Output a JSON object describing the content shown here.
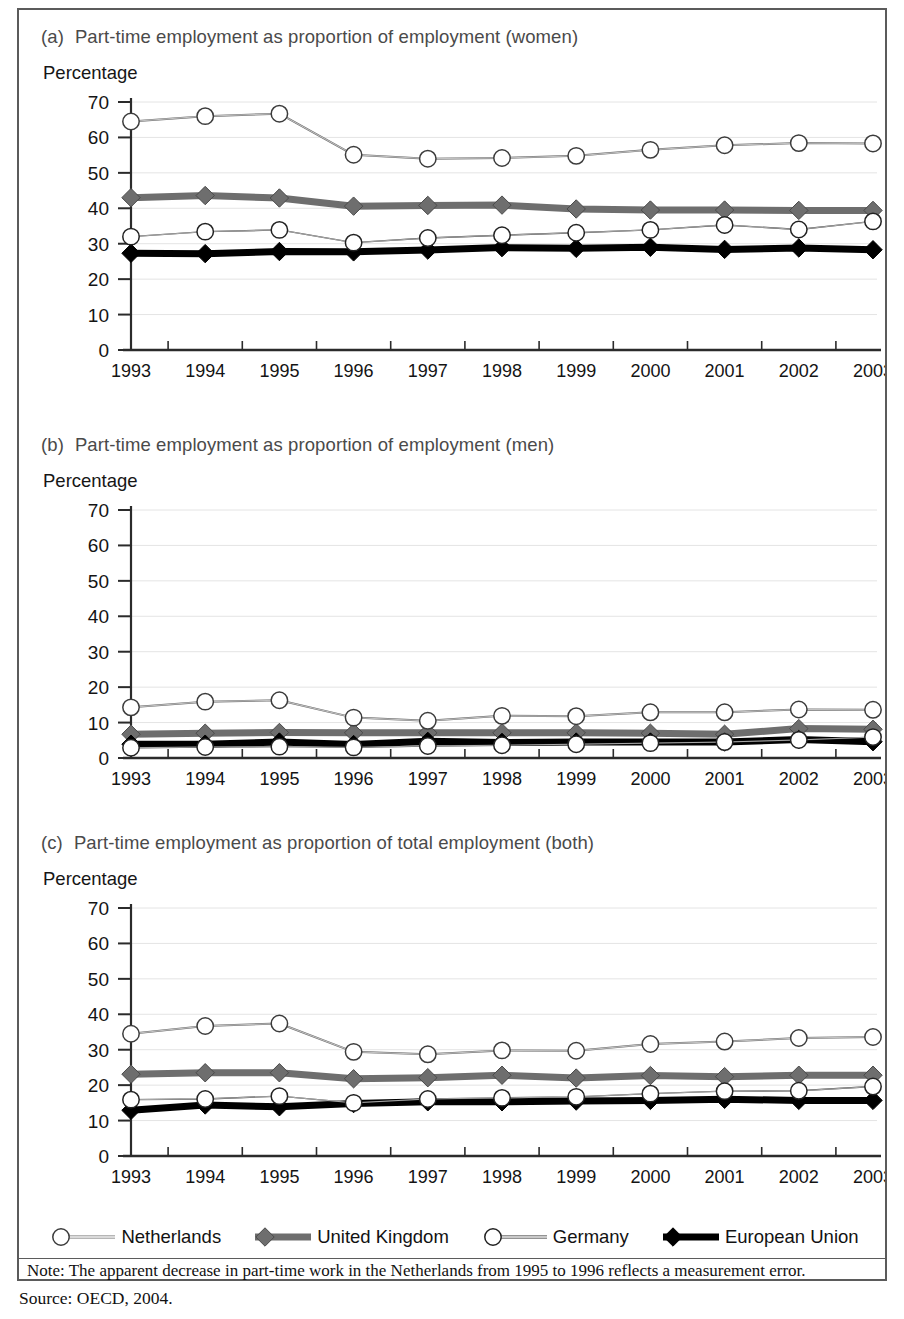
{
  "figure": {
    "note_prefix": "Note:",
    "note": "Note:  The apparent decrease in part-time work in the Netherlands from 1995 to 1996 reflects a measurement error.",
    "source": "Source: OECD, 2004.",
    "frame_color": "#5b5b5b"
  },
  "legend": {
    "position": "bottom",
    "items": [
      {
        "label": "Netherlands",
        "marker": "open-circle",
        "line_color": "#6e6e6e",
        "line_width": 2,
        "marker_fill": "#ffffff",
        "marker_stroke": "#3c3c3c"
      },
      {
        "label": "United Kingdom",
        "marker": "gray-diamond",
        "line_color": "#6e6e6e",
        "line_width": 7,
        "marker_fill": "#6e6e6e",
        "marker_stroke": "#4a4a4a"
      },
      {
        "label": "Germany",
        "marker": "open-circle",
        "line_color": "#2a2a2a",
        "line_width": 1.4,
        "marker_fill": "#ffffff",
        "marker_stroke": "#222222"
      },
      {
        "label": "European Union",
        "marker": "black-diamond",
        "line_color": "#000000",
        "line_width": 7,
        "marker_fill": "#000000",
        "marker_stroke": "#000000"
      }
    ]
  },
  "panels": [
    {
      "tag": "(a)",
      "title": "Part-time employment as proportion of employment (women)",
      "axis_title": "Percentage"
    },
    {
      "tag": "(b)",
      "title": "Part-time employment as proportion of employment (men)",
      "axis_title": "Percentage"
    },
    {
      "tag": "(c)",
      "title": "Part-time employment as proportion of total employment (both)",
      "axis_title": "Percentage"
    }
  ],
  "chart_data": [
    {
      "id": "a",
      "type": "line",
      "title": "(a) Part-time employment as proportion of employment (women)",
      "xlabel": "",
      "ylabel": "Percentage",
      "ylim": [
        0,
        70
      ],
      "yticks": [
        0,
        10,
        20,
        30,
        40,
        50,
        60,
        70
      ],
      "grid": "horizontal-light",
      "legend_position": "figure-bottom",
      "categories": [
        "1993",
        "1994",
        "1995",
        "1996",
        "1997",
        "1998",
        "1999",
        "2000",
        "2001",
        "2002",
        "2003"
      ],
      "series": [
        {
          "name": "Netherlands",
          "values": [
            64.5,
            66.0,
            66.7,
            55.1,
            54.0,
            54.2,
            54.8,
            56.5,
            57.8,
            58.4,
            58.3
          ]
        },
        {
          "name": "United Kingdom",
          "values": [
            43.0,
            43.6,
            42.9,
            40.6,
            40.8,
            40.9,
            39.8,
            39.5,
            39.5,
            39.4,
            39.4
          ]
        },
        {
          "name": "Germany",
          "values": [
            32.0,
            33.4,
            33.9,
            30.3,
            31.6,
            32.4,
            33.1,
            33.9,
            35.3,
            34.0,
            36.3
          ]
        },
        {
          "name": "European Union",
          "values": [
            27.3,
            27.2,
            27.8,
            27.7,
            28.2,
            28.9,
            28.7,
            29.0,
            28.4,
            28.8,
            28.3
          ]
        }
      ]
    },
    {
      "id": "b",
      "type": "line",
      "title": "(b) Part-time employment as proportion of employment (men)",
      "xlabel": "",
      "ylabel": "Percentage",
      "ylim": [
        0,
        70
      ],
      "yticks": [
        0,
        10,
        20,
        30,
        40,
        50,
        60,
        70
      ],
      "grid": "horizontal-light",
      "legend_position": "figure-bottom",
      "categories": [
        "1993",
        "1994",
        "1995",
        "1996",
        "1997",
        "1998",
        "1999",
        "2000",
        "2001",
        "2002",
        "2003"
      ],
      "series": [
        {
          "name": "Netherlands",
          "values": [
            14.3,
            15.9,
            16.3,
            11.4,
            10.5,
            11.9,
            11.8,
            12.9,
            12.9,
            13.7,
            13.6
          ]
        },
        {
          "name": "United Kingdom",
          "values": [
            6.7,
            7.0,
            7.2,
            7.1,
            7.1,
            7.1,
            7.1,
            7.0,
            6.7,
            8.3,
            8.1
          ]
        },
        {
          "name": "Germany",
          "values": [
            2.9,
            3.1,
            3.2,
            3.0,
            3.4,
            3.6,
            3.9,
            4.2,
            4.5,
            5.1,
            5.9
          ]
        },
        {
          "name": "European Union",
          "values": [
            3.9,
            3.9,
            4.5,
            3.8,
            4.7,
            4.4,
            4.5,
            4.5,
            4.5,
            5.2,
            4.6
          ]
        }
      ]
    },
    {
      "id": "c",
      "type": "line",
      "title": "(c) Part-time employment as proportion of total employment (both)",
      "xlabel": "",
      "ylabel": "Percentage",
      "ylim": [
        0,
        70
      ],
      "yticks": [
        0,
        10,
        20,
        30,
        40,
        50,
        60,
        70
      ],
      "grid": "horizontal-light",
      "legend_position": "figure-bottom",
      "categories": [
        "1993",
        "1994",
        "1995",
        "1996",
        "1997",
        "1998",
        "1999",
        "2000",
        "2001",
        "2002",
        "2003"
      ],
      "series": [
        {
          "name": "Netherlands",
          "values": [
            34.5,
            36.7,
            37.4,
            29.4,
            28.7,
            29.8,
            29.7,
            31.6,
            32.3,
            33.3,
            33.6
          ]
        },
        {
          "name": "United Kingdom",
          "values": [
            23.1,
            23.5,
            23.5,
            21.8,
            22.1,
            22.8,
            22.0,
            22.7,
            22.4,
            22.8,
            22.8
          ]
        },
        {
          "name": "Germany",
          "values": [
            15.9,
            16.1,
            16.9,
            15.0,
            16.1,
            16.4,
            16.7,
            17.6,
            18.3,
            18.4,
            19.6
          ]
        },
        {
          "name": "European Union",
          "values": [
            12.9,
            14.4,
            13.9,
            14.8,
            15.3,
            15.3,
            15.5,
            15.7,
            16.0,
            15.7,
            15.7
          ]
        }
      ]
    }
  ]
}
